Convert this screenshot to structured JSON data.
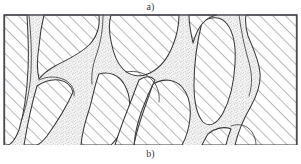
{
  "figure": {
    "caption_top": "a)",
    "caption_bottom": "b)",
    "alt_description": "Schematic cross-section of a microstructure: diagonally hatched grain domains separated by a branching network of stippled (porous) channels.",
    "colors": {
      "background": "#ffffff",
      "outline": "#3a3a3a",
      "hatch_line": "#55555f",
      "border": "#4a4a52",
      "stipple_dot": "#8a8a8a",
      "stipple_fill": "#f2f2f2",
      "caption_text": "#3a3a3a"
    },
    "geometry": {
      "plate_left": 3,
      "plate_top": 14,
      "plate_width": 295,
      "plate_height": 131,
      "hatch_angle_deg": 45,
      "hatch_spacing_px": 9
    },
    "legend_note": "a) upper label; b) lower label"
  }
}
